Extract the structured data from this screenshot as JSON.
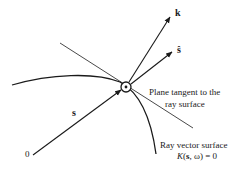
{
  "diagram": {
    "labels": {
      "k": "k",
      "s_hat": "ŝ",
      "s": "s",
      "origin": "0",
      "tangent_line1": "Plane tangent to the",
      "tangent_line2": "ray surface",
      "surface_line1": "Ray vector surface",
      "surface_eq_K": "K",
      "surface_eq_open": "(",
      "surface_eq_s": "s",
      "surface_eq_rest": ", ω) = 0"
    },
    "colors": {
      "ink": "#1a1a1a",
      "background": "#ffffff"
    }
  }
}
